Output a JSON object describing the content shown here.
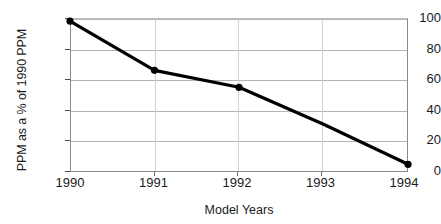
{
  "chart_data": {
    "type": "line",
    "title": "",
    "xlabel": "Model Years",
    "ylabel": "PPM as a % of 1990 PPM",
    "categories": [
      "1990",
      "1991",
      "1992",
      "1993",
      "1994"
    ],
    "x": [
      1990,
      1991,
      1992,
      1993,
      1994
    ],
    "values": [
      98,
      66,
      55,
      31,
      5
    ],
    "series": [
      {
        "name": "PPM as a % of 1990 PPM",
        "values": [
          98,
          66,
          55,
          31,
          5
        ],
        "color": "#000000",
        "marker": "filled-circle",
        "marker_at": [
          1990,
          1991,
          1992,
          1994
        ]
      }
    ],
    "xlim": [
      1990,
      1994
    ],
    "ylim": [
      0,
      100
    ],
    "xticks": [
      1990,
      1991,
      1992,
      1993,
      1994
    ],
    "xtick_labels": [
      "1990",
      "1991",
      "1992",
      "1993",
      "1994"
    ],
    "yticks": [
      0,
      20,
      40,
      60,
      80,
      100
    ],
    "ytick_labels": [
      "0",
      "20",
      "40",
      "60",
      "80",
      "100"
    ],
    "grid": "both",
    "legend": "none",
    "background_color": "#ffffff",
    "grid_color": "#b4b4b4",
    "line_color": "#000000"
  },
  "axes": {
    "y_title": "PPM as a % of 1990 PPM",
    "x_title": "Model Years",
    "y_labels": [
      "100",
      "80",
      "60",
      "40",
      "20",
      "0"
    ],
    "x_labels": [
      "1990",
      "1991",
      "1992",
      "1993",
      "1994"
    ]
  }
}
